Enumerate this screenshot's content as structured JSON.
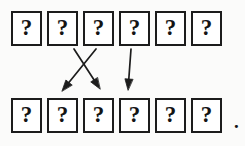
{
  "figure": {
    "background_color": "#fbfbfa",
    "ink_color": "#1c1c1c",
    "box_fill_color": "#ffffff",
    "trailing_punctuation": "."
  },
  "rows": [
    {
      "name": "top-row",
      "cells": [
        {
          "label": "?"
        },
        {
          "label": "?"
        },
        {
          "label": "?"
        },
        {
          "label": "?"
        },
        {
          "label": "?"
        },
        {
          "label": "?"
        }
      ]
    },
    {
      "name": "bottom-row",
      "cells": [
        {
          "label": "?"
        },
        {
          "label": "?"
        },
        {
          "label": "?"
        },
        {
          "label": "?"
        },
        {
          "label": "?"
        },
        {
          "label": "?"
        }
      ]
    }
  ],
  "arrows": [
    {
      "name": "arrow-1",
      "from": {
        "x": 96,
        "y": 49
      },
      "to": {
        "x": 62,
        "y": 91
      },
      "from_cell": "top-cell-3",
      "to_cell": "bottom-cell-2"
    },
    {
      "name": "arrow-2",
      "from": {
        "x": 74,
        "y": 49
      },
      "to": {
        "x": 100,
        "y": 89
      },
      "from_cell": "top-cell-2",
      "to_cell": "bottom-cell-3"
    },
    {
      "name": "arrow-3",
      "from": {
        "x": 131,
        "y": 49
      },
      "to": {
        "x": 128,
        "y": 90
      },
      "from_cell": "top-cell-4",
      "to_cell": "bottom-cell-4"
    }
  ]
}
